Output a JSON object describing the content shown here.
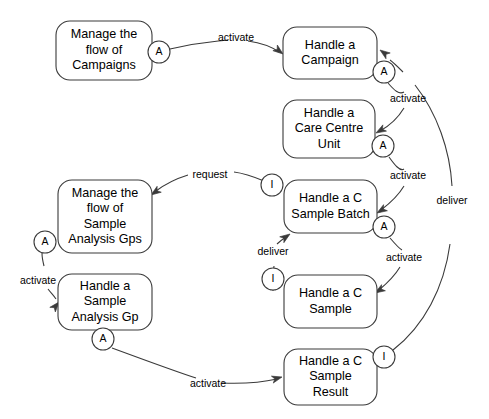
{
  "diagram": {
    "canvas": {
      "width": 489,
      "height": 419,
      "background": "#ffffff"
    },
    "stroke_color": "#3a3a3a",
    "text_color": "#000000",
    "nodes": [
      {
        "id": "manage-campaigns",
        "lines": [
          "Manage the",
          "flow of",
          "Campaigns"
        ],
        "x": 56,
        "y": 21,
        "w": 96,
        "h": 59
      },
      {
        "id": "handle-campaign",
        "lines": [
          "Handle a",
          "Campaign"
        ],
        "x": 283,
        "y": 27,
        "w": 94,
        "h": 52
      },
      {
        "id": "handle-care-centre-unit",
        "lines": [
          "Handle a",
          "Care Centre",
          "Unit"
        ],
        "x": 283,
        "y": 100,
        "w": 92,
        "h": 58
      },
      {
        "id": "manage-sample-analysis-gps",
        "lines": [
          "Manage the",
          "flow of",
          "Sample",
          "Analysis Gps"
        ],
        "x": 58,
        "y": 180,
        "w": 94,
        "h": 73
      },
      {
        "id": "handle-c-sample-batch",
        "lines": [
          "Handle a C",
          "Sample Batch"
        ],
        "x": 284,
        "y": 180,
        "w": 93,
        "h": 53
      },
      {
        "id": "handle-sample-analysis-gp",
        "lines": [
          "Handle a",
          "Sample",
          "Analysis Gp"
        ],
        "x": 58,
        "y": 274,
        "w": 94,
        "h": 56
      },
      {
        "id": "handle-c-sample",
        "lines": [
          "Handle a C",
          "Sample"
        ],
        "x": 284,
        "y": 275,
        "w": 93,
        "h": 53
      },
      {
        "id": "handle-c-sample-result",
        "lines": [
          "Handle a C",
          "Sample",
          "Result"
        ],
        "x": 284,
        "y": 349,
        "w": 93,
        "h": 56
      }
    ],
    "ports": [
      {
        "id": "port-campaigns-a",
        "label": "A",
        "cx": 159,
        "cy": 52,
        "r": 11
      },
      {
        "id": "port-campaign-a",
        "label": "A",
        "cx": 384,
        "cy": 72,
        "r": 11
      },
      {
        "id": "port-care-centre-a",
        "label": "A",
        "cx": 383,
        "cy": 146,
        "r": 11
      },
      {
        "id": "port-sample-batch-i",
        "label": "I",
        "cx": 272,
        "cy": 185,
        "r": 11
      },
      {
        "id": "port-sample-batch-a",
        "label": "A",
        "cx": 384,
        "cy": 227,
        "r": 11
      },
      {
        "id": "port-analysis-gps-a",
        "label": "A",
        "cx": 45,
        "cy": 242,
        "r": 11
      },
      {
        "id": "port-c-sample-i",
        "label": "I",
        "cx": 273,
        "cy": 279,
        "r": 11
      },
      {
        "id": "port-analysis-gp-a",
        "label": "A",
        "cx": 103,
        "cy": 339,
        "r": 11
      },
      {
        "id": "port-sample-result-i",
        "label": "I",
        "cx": 384,
        "cy": 357,
        "r": 11
      }
    ],
    "edges": [
      {
        "id": "edge-activate-campaign",
        "label": "activate",
        "label_x": 236,
        "label_y": 38,
        "path": "M 170,49 C 200,42 210,42 228,40 M 248,41 C 262,43 272,47 279,52",
        "arrow": {
          "x": 283,
          "y": 54,
          "angle": 38
        }
      },
      {
        "id": "edge-activate-care-centre",
        "label": "activate",
        "label_x": 408,
        "label_y": 99,
        "path": "M 388,83 C 394,90 399,95 404,92 M 404,108 C 398,118 389,126 380,131",
        "arrow": {
          "x": 376,
          "y": 133,
          "angle": 150
        }
      },
      {
        "id": "edge-activate-sample-batch",
        "label": "activate",
        "label_x": 408,
        "label_y": 176,
        "path": "M 389,157 C 394,164 400,172 404,169 M 404,186 C 398,196 389,204 381,210",
        "arrow": {
          "x": 377,
          "y": 213,
          "angle": 148
        }
      },
      {
        "id": "edge-activate-c-sample",
        "label": "activate",
        "label_x": 404,
        "label_y": 258,
        "path": "M 390,238 C 396,245 400,249 402,250 M 400,267 C 394,277 385,285 379,290",
        "arrow": {
          "x": 375,
          "y": 293,
          "angle": 148
        }
      },
      {
        "id": "edge-request",
        "label": "request",
        "label_x": 210,
        "label_y": 175,
        "path": "M 264,181 C 252,176 242,173 234,172 M 188,175 C 175,179 164,185 156,191",
        "arrow": {
          "x": 151,
          "y": 195,
          "angle": 145
        }
      },
      {
        "id": "edge-deliver-batch",
        "label": "deliver",
        "label_x": 273,
        "label_y": 252,
        "path": "M 273,291 C 273,280 273,272 274,266 M 277,244 C 280,241 283,239 286,237",
        "arrow": {
          "x": 290,
          "y": 234,
          "angle": 325
        }
      },
      {
        "id": "edge-activate-analysis-gp",
        "label": "activate",
        "label_x": 38,
        "label_y": 281,
        "path": "M 42,253 C 42,258 43,262 44,266 M 48,289 C 51,293 54,296 56,299",
        "arrow": {
          "x": 59,
          "y": 302,
          "angle": 310
        }
      },
      {
        "id": "edge-activate-sample-result",
        "label": "activate",
        "label_x": 208,
        "label_y": 384,
        "path": "M 112,348 C 150,362 180,373 196,378 M 222,383 C 248,384 264,382 277,379",
        "arrow": {
          "x": 282,
          "y": 377,
          "angle": 345
        }
      },
      {
        "id": "edge-deliver-campaign",
        "label": "deliver",
        "label_x": 452,
        "label_y": 201,
        "path": "M 393,350 C 424,326 444,288 450,244 M 452,186 C 450,150 437,113 415,85 M 403,72 C 398,67 394,63 390,60",
        "arrow": {
          "x": 380,
          "y": 50,
          "angle": 216
        }
      }
    ]
  }
}
